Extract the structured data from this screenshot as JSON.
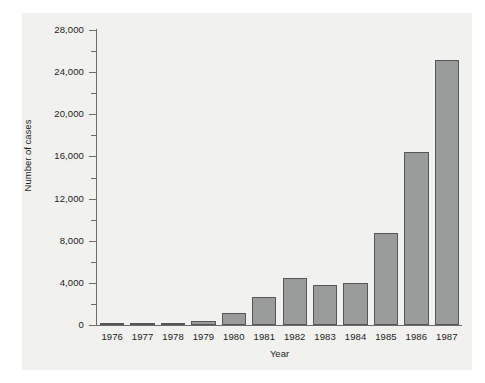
{
  "chart_data": {
    "type": "bar",
    "title": "",
    "xlabel": "Year",
    "ylabel": "Number of cases",
    "categories": [
      "1976",
      "1977",
      "1978",
      "1979",
      "1980",
      "1981",
      "1982",
      "1983",
      "1984",
      "1985",
      "1986",
      "1987"
    ],
    "values": [
      100,
      150,
      200,
      350,
      1100,
      2700,
      4500,
      3800,
      4000,
      8700,
      16400,
      25200
    ],
    "ylim": [
      0,
      28000
    ],
    "y_major_ticks": [
      0,
      4000,
      8000,
      12000,
      16000,
      20000,
      24000,
      28000
    ],
    "y_major_tick_labels": [
      "0",
      "4,000",
      "8,000",
      "12,000",
      "16,000",
      "20,000",
      "24,000",
      "28,000"
    ],
    "y_minor_ticks": [
      2000,
      6000,
      10000,
      14000,
      18000,
      22000,
      26000
    ],
    "grid": false,
    "legend": null,
    "bar_color": "#9a9b9b",
    "bar_edge_color": "#565656",
    "panel_color": "#f1f1ef",
    "axis_color": "#6b6b6b",
    "text_color": "#1c1c1c"
  }
}
